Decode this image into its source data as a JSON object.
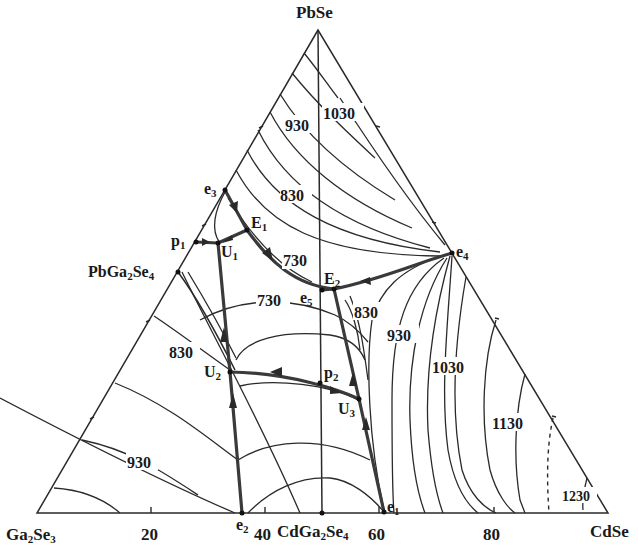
{
  "figure": {
    "type": "ternary liquidus projection",
    "vertices": {
      "top": "PbSe",
      "bottom_left": "Ga2Se3",
      "bottom_right": "CdSe"
    },
    "compounds": {
      "left_edge": "PbGa2Se4",
      "bottom_edge": "CdGa2Se4"
    },
    "bottom_axis_ticks": [
      "20",
      "40",
      "60",
      "80"
    ],
    "isotherm_labels": [
      {
        "id": "iso-930-top",
        "text": "930"
      },
      {
        "id": "iso-1030-top",
        "text": "1030"
      },
      {
        "id": "iso-830-top",
        "text": "830"
      },
      {
        "id": "iso-730-upper",
        "text": "730"
      },
      {
        "id": "iso-730-lower",
        "text": "730"
      },
      {
        "id": "iso-830-right",
        "text": "830"
      },
      {
        "id": "iso-930-right",
        "text": "930"
      },
      {
        "id": "iso-1030-right",
        "text": "1030"
      },
      {
        "id": "iso-1130-right",
        "text": "1130"
      },
      {
        "id": "iso-1230-right",
        "text": "1230"
      },
      {
        "id": "iso-830-left",
        "text": "830"
      },
      {
        "id": "iso-930-left",
        "text": "930"
      }
    ],
    "invariant_points": {
      "e1": {
        "main": "e",
        "sub": "1"
      },
      "e2": {
        "main": "e",
        "sub": "2"
      },
      "e3": {
        "main": "e",
        "sub": "3"
      },
      "e4": {
        "main": "e",
        "sub": "4"
      },
      "e5": {
        "main": "e",
        "sub": "5"
      },
      "E1": {
        "main": "E",
        "sub": "1"
      },
      "E2": {
        "main": "E",
        "sub": "2"
      },
      "U1": {
        "main": "U",
        "sub": "1"
      },
      "U2": {
        "main": "U",
        "sub": "2"
      },
      "U3": {
        "main": "U",
        "sub": "3"
      },
      "p1": {
        "main": "p",
        "sub": "1"
      },
      "p2": {
        "main": "p",
        "sub": "2"
      }
    },
    "vertex_labels": {
      "PbSe": {
        "main": "PbSe"
      },
      "Ga2Se3": {
        "a": "Ga",
        "s1": "2",
        "b": "Se",
        "s2": "3"
      },
      "CdSe": {
        "main": "CdSe"
      },
      "PbGa2Se4": {
        "a": "PbGa",
        "s1": "2",
        "b": "Se",
        "s2": "4"
      },
      "CdGa2Se4": {
        "a": "CdGa",
        "s1": "2",
        "b": "Se",
        "s2": "4"
      }
    }
  }
}
